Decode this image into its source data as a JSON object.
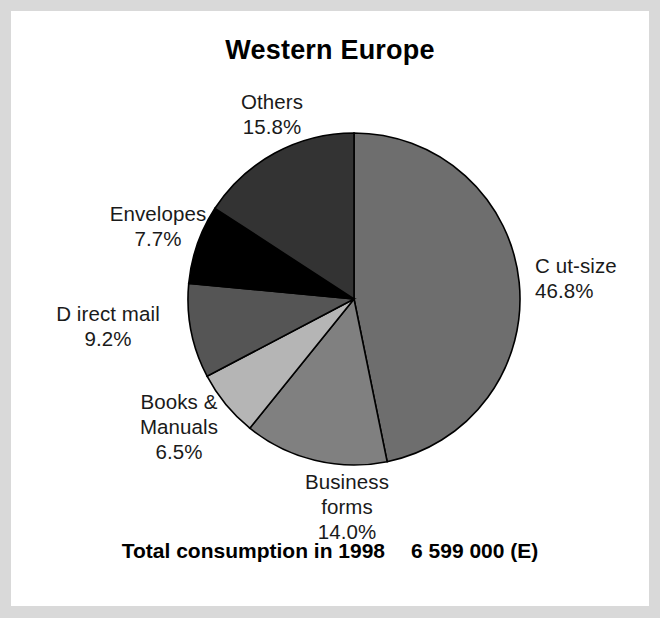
{
  "chart_data": {
    "type": "pie",
    "title": "Western Europe",
    "xlabel": "",
    "ylabel": "",
    "legend_position": "none",
    "grid": false,
    "start_angle_deg": 0,
    "direction": "clockwise",
    "categories": [
      "Cut-size",
      "Business forms",
      "Books & Manuals",
      "Direct mail",
      "Envelopes",
      "Others"
    ],
    "values": [
      46.8,
      14.0,
      6.5,
      9.2,
      7.7,
      15.8
    ],
    "value_unit": "%",
    "slices": [
      {
        "name": "Cut-size",
        "label_line1": "C ut-size",
        "label_line2": "46.8%",
        "value": 46.8,
        "color": "#6e6e6e"
      },
      {
        "name": "Business forms",
        "label_line1": "Business",
        "label_line2": "forms",
        "label_line3": "14.0%",
        "value": 14.0,
        "color": "#808080"
      },
      {
        "name": "Books & Manuals",
        "label_line1": "Books &",
        "label_line2": "Manuals",
        "label_line3": "6.5%",
        "value": 6.5,
        "color": "#b5b5b5"
      },
      {
        "name": "Direct mail",
        "label_line1": "D irect mail",
        "label_line2": "9.2%",
        "value": 9.2,
        "color": "#555555"
      },
      {
        "name": "Envelopes",
        "label_line1": "Envelopes",
        "label_line2": "7.7%",
        "value": 7.7,
        "color": "#000000"
      },
      {
        "name": "Others",
        "label_line1": "Others",
        "label_line2": "15.8%",
        "value": 15.8,
        "color": "#333333"
      }
    ],
    "annotations": [
      {
        "name": "total-consumption",
        "label": "Total consumption in 1998",
        "value": "6 599 000 (E)"
      }
    ]
  },
  "labels": {
    "others": "Others\n15.8%",
    "envelopes": "Envelopes\n7.7%",
    "direct_mail": "D irect mail\n9.2%",
    "books_manuals": "Books &\nManuals\n6.5%",
    "business_forms": "Business\nforms\n14.0%",
    "cut_size": "C ut-size\n46.8%"
  },
  "footer": {
    "total_label": "Total consumption in 1998",
    "total_value": "6 599 000 (E)"
  },
  "style": {
    "frame_color": "#d9d9d9",
    "background": "#ffffff",
    "outline_color": "#000000"
  }
}
